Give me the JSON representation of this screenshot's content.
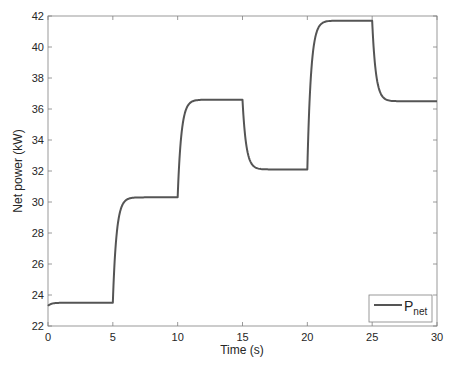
{
  "chart_data": {
    "type": "line",
    "title": "",
    "xlabel": "Time (s)",
    "ylabel": "Net power (kW)",
    "xlim": [
      0,
      30
    ],
    "ylim": [
      22,
      42
    ],
    "x_ticks": [
      0,
      5,
      10,
      15,
      20,
      25,
      30
    ],
    "y_ticks": [
      22,
      24,
      26,
      28,
      30,
      32,
      34,
      36,
      38,
      40,
      42
    ],
    "grid": false,
    "legend": {
      "position": "lower right",
      "entries": [
        {
          "label": "P",
          "subscript": "net"
        }
      ]
    },
    "series": [
      {
        "name": "P_net",
        "color": "#555555",
        "steps": [
          {
            "t_start": 0,
            "t_end": 5,
            "from": 23.3,
            "to": 23.5
          },
          {
            "t_start": 5,
            "t_end": 10,
            "from": 23.5,
            "to": 30.3
          },
          {
            "t_start": 10,
            "t_end": 15,
            "from": 30.3,
            "to": 36.6
          },
          {
            "t_start": 15,
            "t_end": 20,
            "from": 36.6,
            "to": 32.1
          },
          {
            "t_start": 20,
            "t_end": 25,
            "from": 32.1,
            "to": 41.7
          },
          {
            "t_start": 25,
            "t_end": 30,
            "from": 41.7,
            "to": 36.5
          }
        ],
        "plateaus": [
          {
            "x": [
              0,
              5
            ],
            "y": 23.5
          },
          {
            "x": [
              5,
              10
            ],
            "y": 30.3
          },
          {
            "x": [
              10,
              15
            ],
            "y": 36.6
          },
          {
            "x": [
              15,
              20
            ],
            "y": 32.1
          },
          {
            "x": [
              20,
              25
            ],
            "y": 41.7
          },
          {
            "x": [
              25,
              30
            ],
            "y": 36.5
          }
        ],
        "x": [
          0,
          0.5,
          1,
          5,
          5.5,
          6,
          10,
          10.5,
          11,
          15,
          15.5,
          16,
          20,
          20.5,
          21,
          25,
          25.5,
          26,
          30
        ],
        "y": [
          23.3,
          23.45,
          23.5,
          23.5,
          29.2,
          30.2,
          30.3,
          35.5,
          36.5,
          36.6,
          33.3,
          32.2,
          32.1,
          39.5,
          41.4,
          41.7,
          38.0,
          36.7,
          36.5
        ]
      }
    ]
  },
  "axes": {
    "x_label": "Time (s)",
    "y_label": "Net power (kW)",
    "x_tick_labels": [
      "0",
      "5",
      "10",
      "15",
      "20",
      "25",
      "30"
    ],
    "y_tick_labels": [
      "22",
      "24",
      "26",
      "28",
      "30",
      "32",
      "34",
      "36",
      "38",
      "40",
      "42"
    ]
  },
  "legend": {
    "label_main": "P",
    "label_sub": "net"
  },
  "colors": {
    "line": "#555555",
    "axes": "#808080",
    "legend_border": "#808080"
  }
}
